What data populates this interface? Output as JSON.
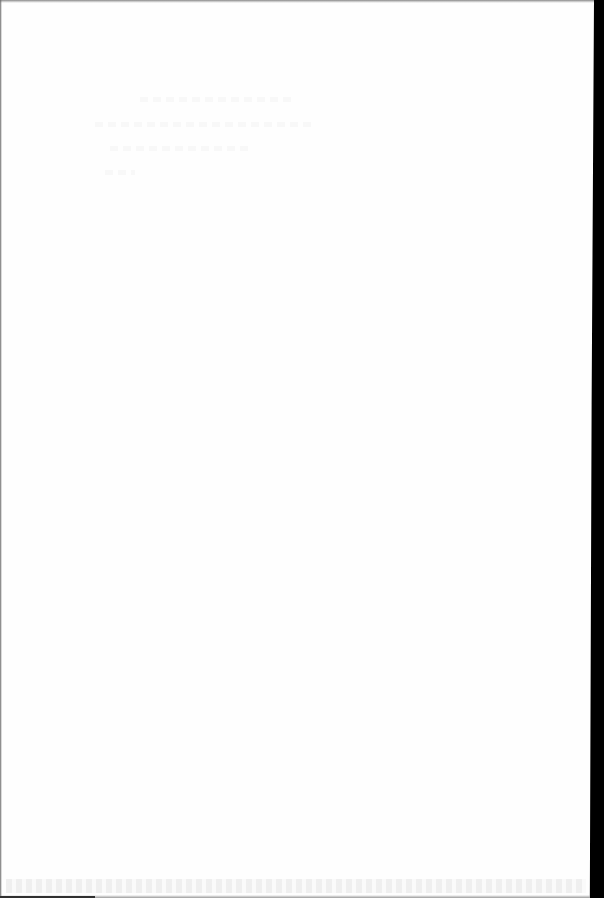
{
  "document": {
    "type": "scanned-blank-page",
    "visible_text": [],
    "colors": {
      "paper": "#fefefe",
      "scanner_background": "#000000",
      "edge_shadow": "#8a8a8a"
    }
  }
}
